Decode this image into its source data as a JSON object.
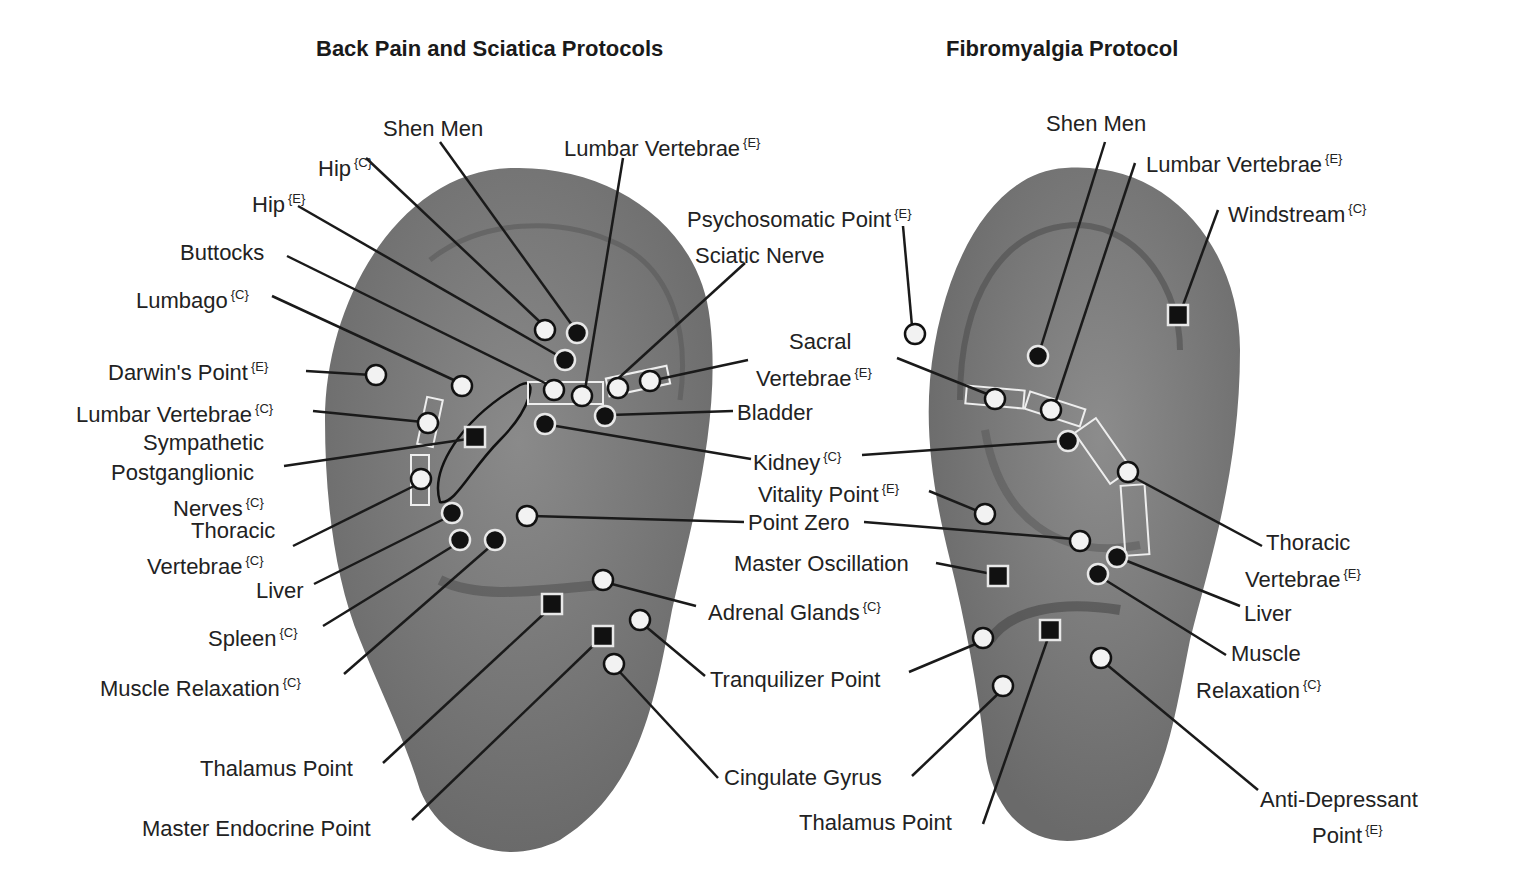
{
  "colors": {
    "background": "#ffffff",
    "ear_fill": "#7c7c7c",
    "ear_shadow": "#555555",
    "text": "#222222",
    "open_marker": "#f2f2f2",
    "filled_marker": "#111111",
    "marker_outline": "#e8e8e8",
    "leader_line": "#1a1a1a"
  },
  "legend_notes": {
    "C": "{C}",
    "E": "{E}"
  },
  "panels": [
    {
      "id": "back-pain",
      "title": "Back Pain and Sciatica Protocols",
      "title_pos": [
        316,
        36
      ],
      "labels": [
        {
          "text": "Shen Men",
          "tag": "",
          "x": 383,
          "y": 116,
          "align": "left"
        },
        {
          "text": "Hip",
          "tag": "{C}",
          "x": 318,
          "y": 150,
          "align": "left"
        },
        {
          "text": "Lumbar Vertebrae",
          "tag": "{E}",
          "x": 564,
          "y": 130,
          "align": "left"
        },
        {
          "text": "Hip",
          "tag": "{E}",
          "x": 252,
          "y": 186,
          "align": "left"
        },
        {
          "text": "Buttocks",
          "tag": "",
          "x": 180,
          "y": 240,
          "align": "left"
        },
        {
          "text": "Lumbago",
          "tag": "{C}",
          "x": 136,
          "y": 282,
          "align": "left"
        },
        {
          "text": "Darwin's Point",
          "tag": "{E}",
          "x": 108,
          "y": 354,
          "align": "left"
        },
        {
          "text": "Lumbar Vertebrae",
          "tag": "{C}",
          "x": 76,
          "y": 396,
          "align": "left"
        },
        {
          "text": "Sympathetic",
          "tag": "",
          "x": 143,
          "y": 430,
          "align": "left"
        },
        {
          "text": "Postganglionic",
          "tag": "",
          "x": 111,
          "y": 460,
          "align": "left"
        },
        {
          "text": "Nerves",
          "tag": "{C}",
          "x": 173,
          "y": 490,
          "align": "left"
        },
        {
          "text": "Thoracic",
          "tag": "",
          "x": 191,
          "y": 518,
          "align": "left"
        },
        {
          "text": "Vertebrae",
          "tag": "{C}",
          "x": 147,
          "y": 548,
          "align": "left"
        },
        {
          "text": "Liver",
          "tag": "",
          "x": 256,
          "y": 578,
          "align": "left"
        },
        {
          "text": "Spleen",
          "tag": "{C}",
          "x": 208,
          "y": 620,
          "align": "left"
        },
        {
          "text": "Muscle Relaxation",
          "tag": "{C}",
          "x": 100,
          "y": 670,
          "align": "left"
        },
        {
          "text": "Thalamus Point",
          "tag": "",
          "x": 200,
          "y": 756,
          "align": "left"
        },
        {
          "text": "Master Endocrine Point",
          "tag": "",
          "x": 142,
          "y": 816,
          "align": "left"
        },
        {
          "text": "Psychosomatic Point",
          "tag": "{E}",
          "x": 687,
          "y": 201,
          "align": "left"
        },
        {
          "text": "Sciatic Nerve",
          "tag": "",
          "x": 695,
          "y": 243,
          "align": "left"
        },
        {
          "text": "Sacral",
          "tag": "",
          "x": 789,
          "y": 329,
          "align": "left"
        },
        {
          "text": "Vertebrae",
          "tag": "{E}",
          "x": 756,
          "y": 360,
          "align": "left"
        },
        {
          "text": "Bladder",
          "tag": "",
          "x": 737,
          "y": 400,
          "align": "left"
        },
        {
          "text": "Kidney",
          "tag": "{C}",
          "x": 753,
          "y": 444,
          "align": "left"
        },
        {
          "text": "Vitality Point",
          "tag": "{E}",
          "x": 758,
          "y": 476,
          "align": "left"
        },
        {
          "text": "Point Zero",
          "tag": "",
          "x": 748,
          "y": 510,
          "align": "left"
        },
        {
          "text": "Master Oscillation",
          "tag": "",
          "x": 734,
          "y": 551,
          "align": "left"
        },
        {
          "text": "Adrenal Glands",
          "tag": "{C}",
          "x": 708,
          "y": 594,
          "align": "left"
        },
        {
          "text": "Tranquilizer Point",
          "tag": "",
          "x": 710,
          "y": 667,
          "align": "left"
        },
        {
          "text": "Cingulate Gyrus",
          "tag": "",
          "x": 724,
          "y": 765,
          "align": "left"
        },
        {
          "text": "Thalamus Point",
          "tag": "",
          "x": 799,
          "y": 810,
          "align": "left"
        }
      ]
    },
    {
      "id": "fibromyalgia",
      "title": "Fibromyalgia Protocol",
      "title_pos": [
        946,
        36
      ],
      "labels": [
        {
          "text": "Shen Men",
          "tag": "",
          "x": 1046,
          "y": 111,
          "align": "left"
        },
        {
          "text": "Lumbar Vertebrae",
          "tag": "{E}",
          "x": 1146,
          "y": 146,
          "align": "left"
        },
        {
          "text": "Windstream",
          "tag": "{C}",
          "x": 1228,
          "y": 196,
          "align": "left"
        },
        {
          "text": "Thoracic",
          "tag": "",
          "x": 1266,
          "y": 530,
          "align": "left"
        },
        {
          "text": "Vertebrae",
          "tag": "{E}",
          "x": 1245,
          "y": 561,
          "align": "left"
        },
        {
          "text": "Liver",
          "tag": "",
          "x": 1244,
          "y": 601,
          "align": "left"
        },
        {
          "text": "Muscle",
          "tag": "",
          "x": 1231,
          "y": 641,
          "align": "left"
        },
        {
          "text": "Relaxation",
          "tag": "{C}",
          "x": 1196,
          "y": 672,
          "align": "left"
        },
        {
          "text": "Anti-Depressant",
          "tag": "",
          "x": 1260,
          "y": 787,
          "align": "left"
        },
        {
          "text": "Point",
          "tag": "{E}",
          "x": 1312,
          "y": 817,
          "align": "left"
        }
      ]
    }
  ],
  "markers": [
    {
      "type": "open",
      "x": 545,
      "y": 330
    },
    {
      "type": "filled",
      "x": 577,
      "y": 333
    },
    {
      "type": "filled",
      "x": 565,
      "y": 360
    },
    {
      "type": "open",
      "x": 376,
      "y": 375
    },
    {
      "type": "open",
      "x": 462,
      "y": 386
    },
    {
      "type": "open",
      "x": 554,
      "y": 390
    },
    {
      "type": "open",
      "x": 582,
      "y": 396
    },
    {
      "type": "open",
      "x": 618,
      "y": 388
    },
    {
      "type": "open",
      "x": 650,
      "y": 381
    },
    {
      "type": "filled",
      "x": 605,
      "y": 416
    },
    {
      "type": "filled",
      "x": 545,
      "y": 424
    },
    {
      "type": "open",
      "x": 428,
      "y": 423
    },
    {
      "type": "square",
      "x": 475,
      "y": 437
    },
    {
      "type": "open",
      "x": 421,
      "y": 479
    },
    {
      "type": "filled",
      "x": 452,
      "y": 513
    },
    {
      "type": "open",
      "x": 527,
      "y": 516
    },
    {
      "type": "filled",
      "x": 460,
      "y": 540
    },
    {
      "type": "filled",
      "x": 495,
      "y": 540
    },
    {
      "type": "open",
      "x": 603,
      "y": 580
    },
    {
      "type": "square",
      "x": 552,
      "y": 604
    },
    {
      "type": "open",
      "x": 640,
      "y": 620
    },
    {
      "type": "square",
      "x": 603,
      "y": 636
    },
    {
      "type": "open",
      "x": 614,
      "y": 664
    },
    {
      "type": "open",
      "x": 915,
      "y": 334
    },
    {
      "type": "filled",
      "x": 1038,
      "y": 356
    },
    {
      "type": "square",
      "x": 1178,
      "y": 315
    },
    {
      "type": "open",
      "x": 995,
      "y": 399
    },
    {
      "type": "open",
      "x": 1051,
      "y": 410
    },
    {
      "type": "filled",
      "x": 1068,
      "y": 441
    },
    {
      "type": "open",
      "x": 1128,
      "y": 472
    },
    {
      "type": "open",
      "x": 985,
      "y": 514
    },
    {
      "type": "open",
      "x": 1080,
      "y": 541
    },
    {
      "type": "filled",
      "x": 1117,
      "y": 557
    },
    {
      "type": "filled",
      "x": 1098,
      "y": 574
    },
    {
      "type": "square",
      "x": 998,
      "y": 576
    },
    {
      "type": "open",
      "x": 983,
      "y": 638
    },
    {
      "type": "square",
      "x": 1050,
      "y": 630
    },
    {
      "type": "open",
      "x": 1101,
      "y": 658
    },
    {
      "type": "open",
      "x": 1003,
      "y": 686
    }
  ],
  "leaders": [
    [
      440,
      142,
      572,
      325
    ],
    [
      366,
      158,
      540,
      322
    ],
    [
      298,
      206,
      557,
      355
    ],
    [
      287,
      256,
      549,
      385
    ],
    [
      272,
      296,
      458,
      382
    ],
    [
      306,
      371,
      372,
      375
    ],
    [
      313,
      411,
      423,
      422
    ],
    [
      284,
      466,
      468,
      439
    ],
    [
      293,
      546,
      418,
      484
    ],
    [
      314,
      584,
      450,
      516
    ],
    [
      323,
      626,
      458,
      543
    ],
    [
      344,
      674,
      492,
      545
    ],
    [
      383,
      763,
      548,
      610
    ],
    [
      412,
      820,
      598,
      641
    ],
    [
      623,
      158,
      585,
      390
    ],
    [
      745,
      263,
      611,
      385
    ],
    [
      748,
      360,
      655,
      380
    ],
    [
      733,
      411,
      610,
      415
    ],
    [
      751,
      459,
      550,
      425
    ],
    [
      744,
      522,
      532,
      516
    ],
    [
      696,
      606,
      608,
      583
    ],
    [
      705,
      676,
      644,
      625
    ],
    [
      718,
      778,
      618,
      670
    ],
    [
      903,
      226,
      912,
      326
    ],
    [
      897,
      358,
      992,
      396
    ],
    [
      862,
      455,
      1062,
      441
    ],
    [
      929,
      491,
      980,
      512
    ],
    [
      864,
      522,
      1074,
      539
    ],
    [
      936,
      563,
      992,
      574
    ],
    [
      909,
      672,
      978,
      643
    ],
    [
      912,
      776,
      1000,
      692
    ],
    [
      983,
      824,
      1048,
      638
    ],
    [
      1105,
      142,
      1040,
      350
    ],
    [
      1135,
      163,
      1055,
      404
    ],
    [
      1218,
      210,
      1182,
      308
    ],
    [
      1262,
      546,
      1135,
      478
    ],
    [
      1240,
      606,
      1122,
      559
    ],
    [
      1226,
      655,
      1102,
      578
    ],
    [
      1258,
      790,
      1106,
      664
    ]
  ]
}
